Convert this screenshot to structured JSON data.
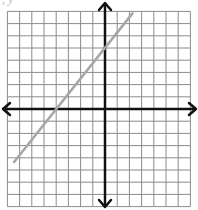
{
  "caption": ", y",
  "chart_data": {
    "type": "line",
    "title": "",
    "xlabel": "",
    "ylabel": "",
    "grid": true,
    "xlim": [
      -8,
      7
    ],
    "ylim": [
      -8,
      8
    ],
    "axes_arrows": true,
    "series": [
      {
        "name": "line",
        "equation": "y = 1.25x + 5",
        "slope": 1.25,
        "y_intercept": 5,
        "x_intercept": -4,
        "x": [
          -7.5,
          2.3
        ],
        "y": [
          -4.4,
          7.9
        ],
        "color": "#a6a6a6"
      }
    ]
  },
  "colors": {
    "grid": "#8c8c8c",
    "axes": "#111111",
    "line": "#a6a6a6",
    "background": "#ffffff"
  }
}
